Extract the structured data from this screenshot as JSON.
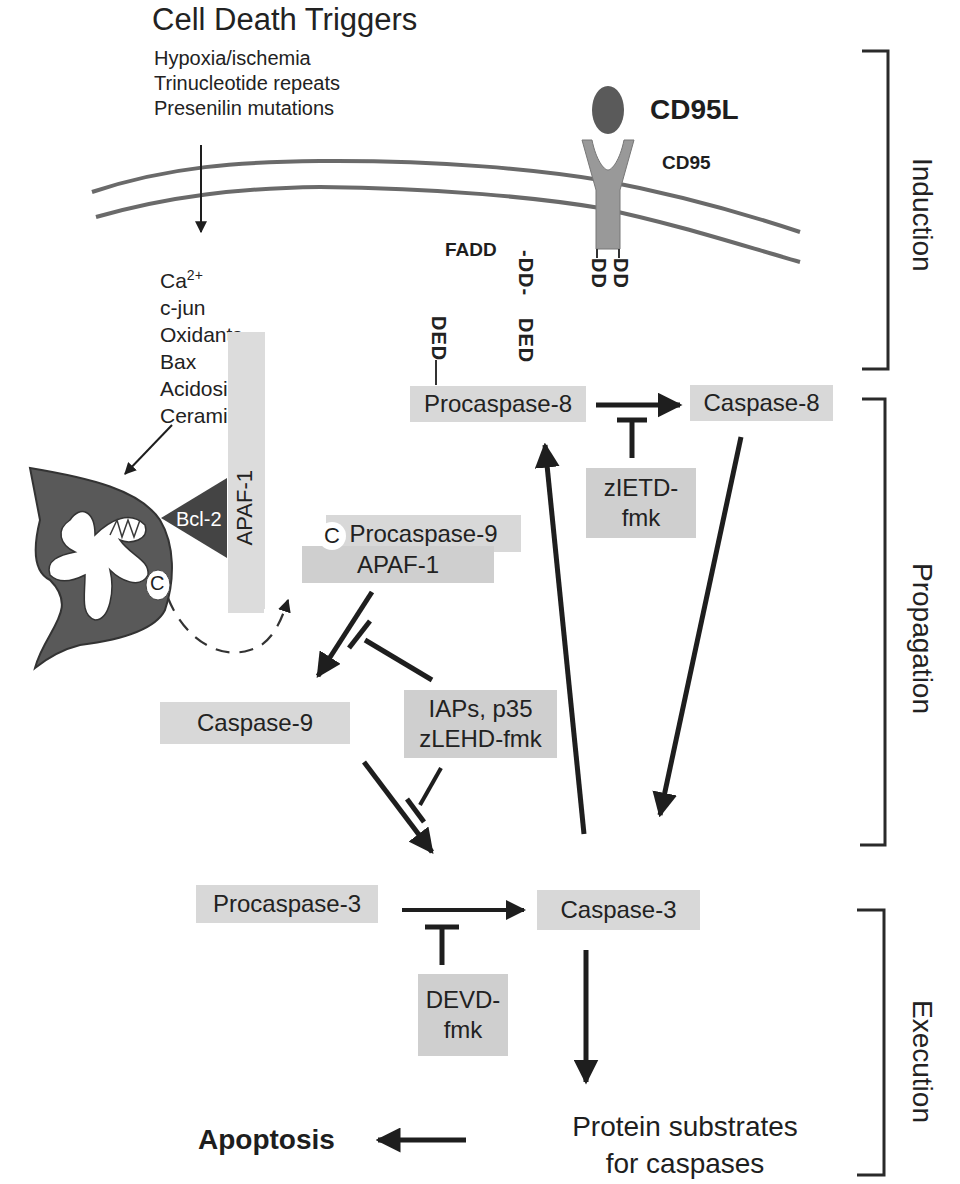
{
  "triggers": {
    "title": "Cell Death Triggers",
    "items": [
      "Hypoxia/ischemia",
      "Trinucleotide repeats",
      "Presenilin mutations"
    ]
  },
  "mediators": {
    "items": [
      {
        "base": "Ca",
        "sup": "2+"
      },
      {
        "base": "c-jun",
        "sup": ""
      },
      {
        "base": "Oxidants",
        "sup": ""
      },
      {
        "base": "Bax",
        "sup": ""
      },
      {
        "base": "Acidosis",
        "sup": ""
      },
      {
        "base": "Ceramide",
        "sup": ""
      }
    ]
  },
  "receptor": {
    "ligand": "CD95L",
    "receptor": "CD95",
    "adaptor": "FADD",
    "receptor_domain": "DD",
    "fadd_domain_1": "-DD-",
    "fadd_domain_2": "DED",
    "procaspase_domain": "DED"
  },
  "mitochondrion": {
    "bcl2": "Bcl-2",
    "apaf1": "APAF-1",
    "cytochrome_c": "C"
  },
  "nodes": {
    "procaspase8": "Procaspase-8",
    "caspase8": "Caspase-8",
    "zietd_line1": "zIETD-",
    "zietd_line2": "fmk",
    "procaspase9": "Procaspase-9",
    "apaf1_complex": "APAF-1",
    "complex_c": "C",
    "caspase9": "Caspase-9",
    "iaps_line1": "IAPs, p35",
    "iaps_line2": "zLEHD-fmk",
    "procaspase3": "Procaspase-3",
    "caspase3": "Caspase-3",
    "devd_line1": "DEVD-",
    "devd_line2": "fmk",
    "substrates_line1": "Protein substrates",
    "substrates_line2": "for caspases",
    "apoptosis": "Apoptosis"
  },
  "stages": {
    "induction": "Induction",
    "propagation": "Propagation",
    "execution": "Execution"
  },
  "colors": {
    "box_fill": "#d8d8d8",
    "mito_fill": "#595959",
    "ligand_fill": "#5a5a5a",
    "receptor_fill": "#999999",
    "membrane": "#6a6a6a",
    "arrow": "#1e1e1e"
  }
}
